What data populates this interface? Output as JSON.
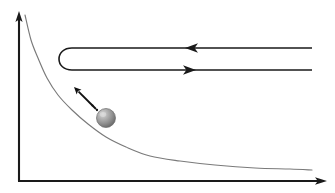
{
  "figure": {
    "title": "",
    "background_color": "#ffffff",
    "width": 335,
    "height": 193
  },
  "axes": {
    "color": "#1a1a1a",
    "stroke_width": 2.1,
    "origin": {
      "x": 19,
      "y": 181
    },
    "y_axis": {
      "name": "y-axis",
      "from": {
        "x": 19,
        "y": 181
      },
      "to": {
        "x": 19,
        "y": 14
      },
      "arrowhead": "up",
      "label": ""
    },
    "x_axis": {
      "name": "x-axis",
      "from": {
        "x": 19,
        "y": 181
      },
      "to": {
        "x": 326,
        "y": 181
      },
      "arrowhead": "right",
      "label": ""
    }
  },
  "potential_curve": {
    "name": "decaying-potential-curve",
    "color": "#7a7a7a",
    "stroke_width": 1.15,
    "description": "monotonically decreasing hyperbola-like curve approaching the x-axis asymptotically",
    "points": [
      {
        "x": 25,
        "y": 15
      },
      {
        "x": 31,
        "y": 40
      },
      {
        "x": 38,
        "y": 58
      },
      {
        "x": 47,
        "y": 78
      },
      {
        "x": 58,
        "y": 95
      },
      {
        "x": 72,
        "y": 110
      },
      {
        "x": 88,
        "y": 124
      },
      {
        "x": 106,
        "y": 137
      },
      {
        "x": 126,
        "y": 147
      },
      {
        "x": 150,
        "y": 156
      },
      {
        "x": 180,
        "y": 161
      },
      {
        "x": 215,
        "y": 165
      },
      {
        "x": 255,
        "y": 168
      },
      {
        "x": 290,
        "y": 169
      },
      {
        "x": 312,
        "y": 170
      }
    ]
  },
  "ray_loop": {
    "name": "u-turn-ray-path",
    "color": "#1a1a1a",
    "stroke_width": 1.6,
    "turn_left_x": 61,
    "top_line_y": 48,
    "bottom_line_y": 70,
    "right_end_x": 312,
    "corner_radius": 11,
    "arrows": [
      {
        "name": "incoming-arrow",
        "direction": "left",
        "tip": {
          "x": 185,
          "y": 48
        },
        "on_line": "top"
      },
      {
        "name": "outgoing-arrow",
        "direction": "right",
        "tip": {
          "x": 196,
          "y": 70
        },
        "on_line": "bottom"
      }
    ]
  },
  "sphere": {
    "name": "particle-sphere",
    "center": {
      "x": 106,
      "y": 118
    },
    "radius": 9.5,
    "fill_light": "#cfcfcf",
    "fill_mid": "#9a9a9a",
    "fill_dark": "#6e6e6e",
    "edge_color": "#6b6b6b",
    "highlight_offset": {
      "x": -3,
      "y": -3.5
    },
    "label": ""
  },
  "velocity_arrow": {
    "name": "velocity-arrow",
    "color": "#111111",
    "stroke_width": 1.9,
    "style": "solid-shaft-with-trailing-dots",
    "tail": {
      "x": 93,
      "y": 106
    },
    "tip": {
      "x": 74,
      "y": 87
    },
    "dots": [
      {
        "x": 97,
        "y": 110,
        "r": 1.15
      },
      {
        "x": 92.5,
        "y": 105.5,
        "r": 1.05
      }
    ],
    "label": ""
  }
}
